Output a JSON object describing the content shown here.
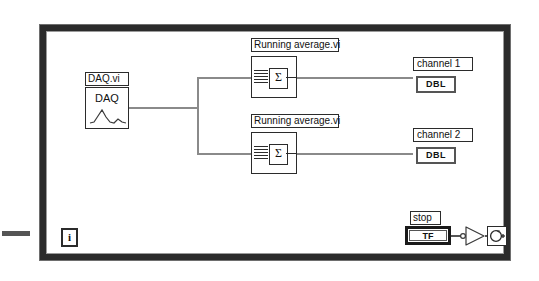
{
  "diagram": {
    "structure": "while-loop",
    "colors": {
      "loop_border": "#2b2b2b",
      "wire": "#8a8a8a",
      "node_border": "#2b2b2b",
      "background": "#ffffff"
    }
  },
  "daq_vi": {
    "label": "DAQ.vi",
    "icon_text": "DAQ",
    "icon_glyph": "waveform-icon"
  },
  "running_average": [
    {
      "label": "Running average.vi",
      "icon_glyph": "sigma-icon",
      "symbol": "Σ"
    },
    {
      "label": "Running average.vi",
      "icon_glyph": "sigma-icon",
      "symbol": "Σ"
    }
  ],
  "indicators": [
    {
      "label": "channel 1",
      "datatype": "DBL"
    },
    {
      "label": "channel 2",
      "datatype": "DBL"
    }
  ],
  "stop_control": {
    "label": "stop",
    "datatype": "TF"
  },
  "not_gate": {
    "name": "not-function",
    "glyph": "not-gate-icon"
  },
  "loop_condition": {
    "name": "continue-if-true-terminal",
    "glyph": "loop-condition-icon"
  },
  "iteration_terminal": {
    "label": "i",
    "name": "iteration-terminal"
  },
  "external_stub": {
    "name": "wire-stub"
  }
}
